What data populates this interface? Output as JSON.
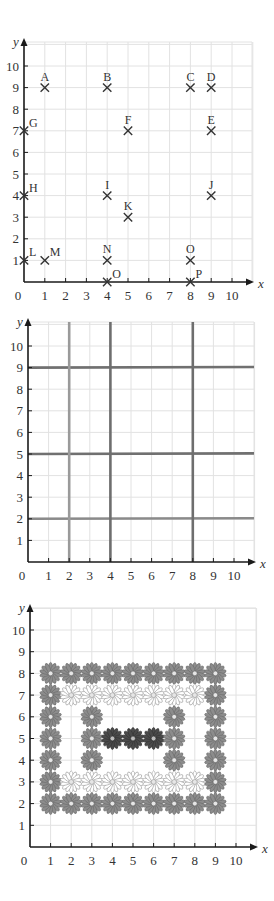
{
  "chart_data": [
    {
      "type": "scatter",
      "title": "",
      "xlabel": "x",
      "ylabel": "y",
      "xlim": [
        0,
        10
      ],
      "ylim": [
        0,
        10
      ],
      "grid": true,
      "x_ticks": [
        "0",
        "1",
        "2",
        "3",
        "4",
        "5",
        "6",
        "7",
        "8",
        "9",
        "10"
      ],
      "y_ticks": [
        "1",
        "2",
        "3",
        "4",
        "5",
        "6",
        "7",
        "8",
        "9",
        "10"
      ],
      "marker": "cross",
      "points": [
        {
          "label": "A",
          "x": 1,
          "y": 9
        },
        {
          "label": "B",
          "x": 4,
          "y": 9
        },
        {
          "label": "C",
          "x": 8,
          "y": 9
        },
        {
          "label": "D",
          "x": 9,
          "y": 9
        },
        {
          "label": "E",
          "x": 9,
          "y": 7
        },
        {
          "label": "F",
          "x": 5,
          "y": 7
        },
        {
          "label": "G",
          "x": 0,
          "y": 7
        },
        {
          "label": "H",
          "x": 0,
          "y": 4
        },
        {
          "label": "I",
          "x": 4,
          "y": 4
        },
        {
          "label": "J",
          "x": 9,
          "y": 4
        },
        {
          "label": "K",
          "x": 5,
          "y": 3
        },
        {
          "label": "L",
          "x": 0,
          "y": 1
        },
        {
          "label": "M",
          "x": 1,
          "y": 1
        },
        {
          "label": "N",
          "x": 4,
          "y": 1
        },
        {
          "label": "O",
          "x": 8,
          "y": 1
        },
        {
          "label": "O",
          "x": 4,
          "y": 0
        },
        {
          "label": "P",
          "x": 8,
          "y": 0
        }
      ]
    },
    {
      "type": "line",
      "title": "",
      "xlabel": "x",
      "ylabel": "y",
      "xlim": [
        0,
        10
      ],
      "ylim": [
        0,
        10
      ],
      "grid": true,
      "x_ticks": [
        "0",
        "1",
        "2",
        "3",
        "4",
        "5",
        "6",
        "7",
        "8",
        "9",
        "10"
      ],
      "y_ticks": [
        "1",
        "2",
        "3",
        "4",
        "5",
        "6",
        "7",
        "8",
        "9",
        "10"
      ],
      "vertical_lines": [
        {
          "x": 2,
          "color": "#9a9a9a"
        },
        {
          "x": 4,
          "color": "#6e6e6e"
        },
        {
          "x": 8,
          "color": "#6e6e6e"
        }
      ],
      "horizontal_lines": [
        {
          "y": 2,
          "color": "#8a8a8a"
        },
        {
          "y": 5,
          "color": "#707070"
        },
        {
          "y": 9,
          "color": "#707070"
        }
      ]
    },
    {
      "type": "scatter",
      "title": "",
      "xlabel": "x",
      "ylabel": "y",
      "xlim": [
        0,
        10
      ],
      "ylim": [
        0,
        10
      ],
      "grid": true,
      "x_ticks": [
        "0",
        "1",
        "2",
        "3",
        "4",
        "5",
        "6",
        "7",
        "8",
        "9",
        "10"
      ],
      "y_ticks": [
        "1",
        "2",
        "3",
        "4",
        "5",
        "6",
        "7",
        "8",
        "9",
        "10"
      ],
      "marker": "flower",
      "styles": {
        "medium": {
          "fill": "#8c8c8c",
          "stroke": "#6a6a6a"
        },
        "light": {
          "fill": "#ffffff",
          "stroke": "#9a9a9a"
        },
        "dark": {
          "fill": "#4a4a4a",
          "stroke": "#333333"
        }
      },
      "points": [
        {
          "x": 1,
          "y": 8,
          "style": "medium"
        },
        {
          "x": 2,
          "y": 8,
          "style": "medium"
        },
        {
          "x": 3,
          "y": 8,
          "style": "medium"
        },
        {
          "x": 4,
          "y": 8,
          "style": "medium"
        },
        {
          "x": 5,
          "y": 8,
          "style": "medium"
        },
        {
          "x": 6,
          "y": 8,
          "style": "medium"
        },
        {
          "x": 7,
          "y": 8,
          "style": "medium"
        },
        {
          "x": 8,
          "y": 8,
          "style": "medium"
        },
        {
          "x": 9,
          "y": 8,
          "style": "medium"
        },
        {
          "x": 1,
          "y": 7,
          "style": "medium"
        },
        {
          "x": 2,
          "y": 7,
          "style": "light"
        },
        {
          "x": 3,
          "y": 7,
          "style": "light"
        },
        {
          "x": 4,
          "y": 7,
          "style": "light"
        },
        {
          "x": 5,
          "y": 7,
          "style": "light"
        },
        {
          "x": 6,
          "y": 7,
          "style": "light"
        },
        {
          "x": 7,
          "y": 7,
          "style": "light"
        },
        {
          "x": 8,
          "y": 7,
          "style": "light"
        },
        {
          "x": 9,
          "y": 7,
          "style": "medium"
        },
        {
          "x": 1,
          "y": 6,
          "style": "medium"
        },
        {
          "x": 3,
          "y": 6,
          "style": "medium"
        },
        {
          "x": 7,
          "y": 6,
          "style": "medium"
        },
        {
          "x": 9,
          "y": 6,
          "style": "medium"
        },
        {
          "x": 1,
          "y": 5,
          "style": "medium"
        },
        {
          "x": 3,
          "y": 5,
          "style": "medium"
        },
        {
          "x": 4,
          "y": 5,
          "style": "dark"
        },
        {
          "x": 5,
          "y": 5,
          "style": "dark"
        },
        {
          "x": 6,
          "y": 5,
          "style": "dark"
        },
        {
          "x": 7,
          "y": 5,
          "style": "medium"
        },
        {
          "x": 9,
          "y": 5,
          "style": "medium"
        },
        {
          "x": 1,
          "y": 4,
          "style": "medium"
        },
        {
          "x": 3,
          "y": 4,
          "style": "medium"
        },
        {
          "x": 7,
          "y": 4,
          "style": "medium"
        },
        {
          "x": 9,
          "y": 4,
          "style": "medium"
        },
        {
          "x": 1,
          "y": 3,
          "style": "medium"
        },
        {
          "x": 2,
          "y": 3,
          "style": "light"
        },
        {
          "x": 3,
          "y": 3,
          "style": "light"
        },
        {
          "x": 4,
          "y": 3,
          "style": "light"
        },
        {
          "x": 5,
          "y": 3,
          "style": "light"
        },
        {
          "x": 6,
          "y": 3,
          "style": "light"
        },
        {
          "x": 7,
          "y": 3,
          "style": "light"
        },
        {
          "x": 8,
          "y": 3,
          "style": "light"
        },
        {
          "x": 9,
          "y": 3,
          "style": "medium"
        },
        {
          "x": 1,
          "y": 2,
          "style": "medium"
        },
        {
          "x": 2,
          "y": 2,
          "style": "medium"
        },
        {
          "x": 3,
          "y": 2,
          "style": "medium"
        },
        {
          "x": 4,
          "y": 2,
          "style": "medium"
        },
        {
          "x": 5,
          "y": 2,
          "style": "medium"
        },
        {
          "x": 6,
          "y": 2,
          "style": "medium"
        },
        {
          "x": 7,
          "y": 2,
          "style": "medium"
        },
        {
          "x": 8,
          "y": 2,
          "style": "medium"
        },
        {
          "x": 9,
          "y": 2,
          "style": "medium"
        }
      ]
    }
  ],
  "colors": {
    "grid": "#e2e2e2",
    "axis": "#1a1a1a",
    "text": "#333333",
    "marker": "#333333"
  }
}
